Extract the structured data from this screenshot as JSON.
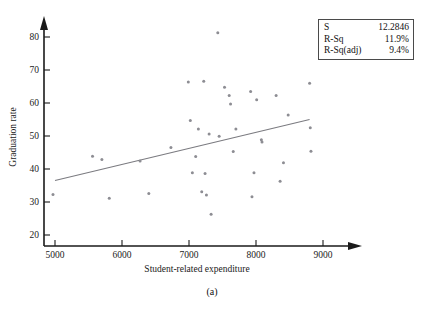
{
  "figure": {
    "caption": "(a)"
  },
  "stats_box": {
    "rows": [
      {
        "label": "S",
        "value": "12.2846"
      },
      {
        "label": "R-Sq",
        "value": "11.9%"
      },
      {
        "label": "R-Sq(adj)",
        "value": "9.4%"
      }
    ]
  },
  "chart_data": {
    "type": "scatter",
    "title": "",
    "xlabel": "Student-related expenditure",
    "ylabel": "Graduation rate",
    "xlim": [
      4700,
      9150
    ],
    "ylim": [
      17,
      84
    ],
    "xticks": [
      5000,
      6000,
      7000,
      8000,
      9000
    ],
    "yticks": [
      20,
      30,
      40,
      50,
      60,
      70,
      80
    ],
    "xtick_labels": [
      "5000",
      "6000",
      "7000",
      "8000",
      "9000"
    ],
    "ytick_labels": [
      "20",
      "30",
      "40",
      "50",
      "60",
      "70",
      "80"
    ],
    "grid": false,
    "legend": null,
    "axis_style": "arrow-ended",
    "point_color": "#8d8d93",
    "line_color": "#7b7b80",
    "points": [
      [
        4970,
        32.3
      ],
      [
        5560,
        43.9
      ],
      [
        5700,
        42.9
      ],
      [
        5810,
        31.1
      ],
      [
        6270,
        42.4
      ],
      [
        6400,
        32.6
      ],
      [
        6730,
        46.5
      ],
      [
        6990,
        66.4
      ],
      [
        7020,
        54.7
      ],
      [
        7050,
        38.9
      ],
      [
        7100,
        43.8
      ],
      [
        7140,
        52.1
      ],
      [
        7190,
        33.1
      ],
      [
        7220,
        66.6
      ],
      [
        7240,
        38.6
      ],
      [
        7260,
        32.1
      ],
      [
        7300,
        50.6
      ],
      [
        7330,
        26.3
      ],
      [
        7430,
        81.3
      ],
      [
        7450,
        49.9
      ],
      [
        7530,
        64.8
      ],
      [
        7600,
        62.3
      ],
      [
        7620,
        59.7
      ],
      [
        7660,
        45.3
      ],
      [
        7700,
        52.1
      ],
      [
        7920,
        63.5
      ],
      [
        7940,
        31.6
      ],
      [
        7970,
        38.9
      ],
      [
        8010,
        61.0
      ],
      [
        8080,
        48.9
      ],
      [
        8090,
        48.2
      ],
      [
        8300,
        62.3
      ],
      [
        8360,
        36.3
      ],
      [
        8410,
        41.9
      ],
      [
        8480,
        56.4
      ],
      [
        8800,
        66.0
      ],
      [
        8810,
        52.5
      ],
      [
        8820,
        45.4
      ]
    ],
    "fit_line": {
      "x_start": 5000,
      "y_start": 36.5,
      "x_end": 8800,
      "y_end": 55.0
    },
    "annotations": {
      "S": "12.2846",
      "R-Sq": "11.9%",
      "R-Sq(adj)": "9.4%"
    }
  }
}
